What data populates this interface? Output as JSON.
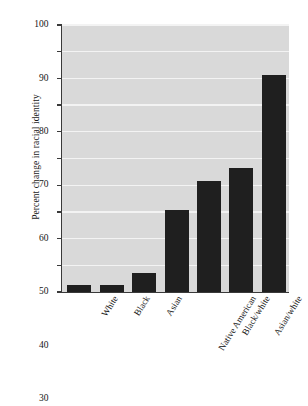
{
  "chart_data": {
    "type": "bar",
    "title": "",
    "xlabel": "",
    "ylabel": "Percent change in racial identity",
    "ylim": [
      0,
      100
    ],
    "yticks": [
      0,
      10,
      20,
      30,
      40,
      50,
      60,
      70,
      80,
      90,
      100
    ],
    "ytick_labels": [
      "0",
      "10",
      "20",
      "30",
      "40",
      "50",
      "60",
      "70",
      "80",
      "90",
      "100"
    ],
    "grid": true,
    "legend": "none",
    "categories": [
      "White",
      "Black",
      "Asian",
      "Native American",
      "Black/white",
      "Asian/white",
      "Native American/\nwhite"
    ],
    "values": [
      2.6,
      2.7,
      7.0,
      30.6,
      41.5,
      46.6,
      81.4
    ],
    "bar_color": "#1f1f1f",
    "plot_background": "#d9d9d9",
    "gridline_color": "#f3f3f3",
    "axis_color": "#3a3a3a"
  },
  "axis": {
    "y_title": "Percent change in racial identity"
  }
}
